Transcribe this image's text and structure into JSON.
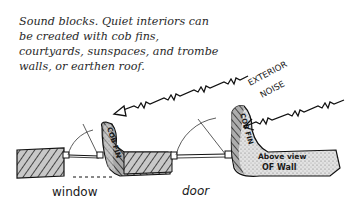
{
  "caption": {
    "lines": [
      "Sound blocks. Quiet interiors can",
      "be created with cob fins,",
      "courtyards, sunspaces, and trombe",
      "walls, or earthen roof."
    ]
  },
  "labels": {
    "exterior": "EXTERIOR",
    "noise": "NOISE",
    "cob_fin_left": "COB FIN",
    "cob_fin_right": "COB FIN",
    "above_view": "Above view",
    "of_wall": "OF Wall",
    "window": "window",
    "door": "door"
  },
  "colors": {
    "ink": "#1a1a1a",
    "wall_fill": "#bdbdbd",
    "fin_fill": "#9a9a9a",
    "paper": "#ffffff"
  }
}
